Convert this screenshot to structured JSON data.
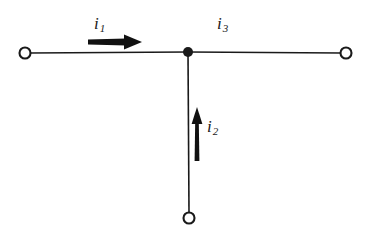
{
  "figure": {
    "type": "circuit-diagram",
    "title": "",
    "background_color": "#ffffff",
    "ink_color": "#1a1a1a",
    "width": 371,
    "height": 240
  },
  "labels": {
    "i1": {
      "symbol": "i",
      "subscript": "1",
      "text": "i1"
    },
    "i2": {
      "symbol": "i",
      "subscript": "2",
      "text": "i2"
    },
    "i3": {
      "symbol": "i",
      "subscript": "3",
      "text": "i3"
    }
  },
  "nodes": {
    "junction": {
      "name": "junction-node",
      "x": 188,
      "y": 52,
      "filled": true,
      "radius": 5
    },
    "terminal_left": {
      "name": "terminal-left",
      "x": 25,
      "y": 53,
      "filled": false,
      "radius": 5.5
    },
    "terminal_right": {
      "name": "terminal-right",
      "x": 346,
      "y": 53,
      "filled": false,
      "radius": 5.5
    },
    "terminal_bottom": {
      "name": "terminal-bottom",
      "x": 189,
      "y": 218,
      "filled": false,
      "radius": 5.5
    }
  },
  "wires": [
    {
      "name": "wire-left-branch",
      "from": "terminal-left",
      "to": "junction",
      "x1": 30,
      "y1": 53,
      "x2": 188,
      "y2": 52
    },
    {
      "name": "wire-right-branch",
      "from": "junction",
      "to": "terminal-right",
      "x1": 188,
      "y1": 52,
      "x2": 341,
      "y2": 53
    },
    {
      "name": "wire-bottom-branch",
      "from": "junction",
      "to": "terminal-bottom",
      "x1": 188,
      "y1": 52,
      "x2": 189,
      "y2": 213
    }
  ],
  "arrows": [
    {
      "name": "current-arrow-i1",
      "label": "i1",
      "direction": "right",
      "x1": 88,
      "y1": 42,
      "x2": 142,
      "y2": 42
    },
    {
      "name": "current-arrow-i2",
      "label": "i2",
      "direction": "up",
      "x1": 197,
      "y1": 161,
      "x2": 197,
      "y2": 107
    }
  ]
}
